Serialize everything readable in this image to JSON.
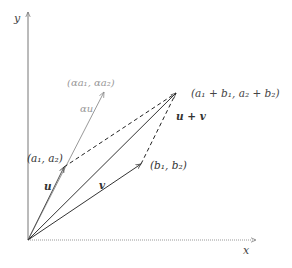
{
  "diagram": {
    "axes": {
      "x_label": "x",
      "y_label": "y",
      "color": "#777777"
    },
    "points": {
      "origin": [
        28,
        240
      ],
      "u_tip": [
        64,
        167
      ],
      "v_tip": [
        141,
        164
      ],
      "sum_tip": [
        176,
        93
      ],
      "alpha_u_tip": [
        104,
        92
      ]
    },
    "labels": {
      "u_point": "(a₁, a₂)",
      "v_point": "(b₁, b₂)",
      "sum_point": "(a₁ + b₁, a₂ + b₂)",
      "alpha_u_point": "(αa₁, αa₂)",
      "u_vec": "u",
      "v_vec": "v",
      "sum_vec": "u + v",
      "alpha_u_vec": "αu"
    },
    "colors": {
      "main": "#333333",
      "light": "#888888",
      "dashed": "#222222"
    }
  }
}
